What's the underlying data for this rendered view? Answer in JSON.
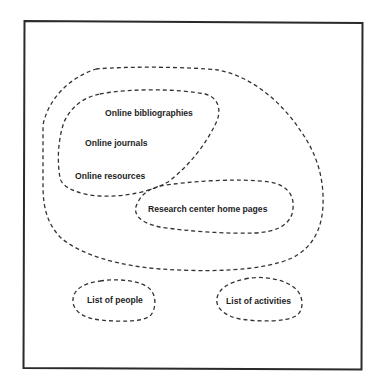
{
  "diagram": {
    "type": "euler-diagram",
    "frame": {
      "stroke_color": "#2a2a2a"
    },
    "line_color": "#333333",
    "text_color": "#1e1e1e",
    "groups": [
      {
        "id": "outer-region",
        "contains": [
          "online-region",
          "research-region"
        ],
        "labels": []
      },
      {
        "id": "online-region",
        "labels": [
          "Online bibliographies",
          "Online journals",
          "Online resources"
        ]
      },
      {
        "id": "research-region",
        "labels": [
          "Research center home pages"
        ]
      },
      {
        "id": "people-region",
        "labels": [
          "List of people"
        ]
      },
      {
        "id": "activities-region",
        "labels": [
          "List of activities"
        ]
      }
    ],
    "labels": {
      "online_bibliographies": "Online bibliographies",
      "online_journals": "Online journals",
      "online_resources": "Online resources",
      "research_center": "Research center home pages",
      "list_of_people": "List of people",
      "list_of_activities": "List of activities"
    }
  }
}
